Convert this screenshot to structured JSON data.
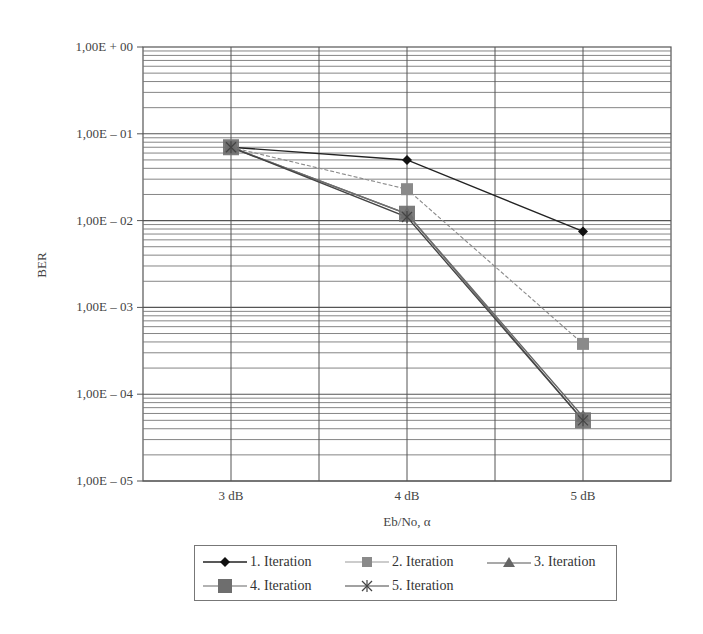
{
  "chart_data": {
    "type": "line",
    "title": "",
    "xlabel": "Eb/No, α",
    "ylabel": "BER",
    "yscale": "log",
    "ylim": [
      1e-05,
      1
    ],
    "categories": [
      "3 dB",
      "4 dB",
      "5 dB"
    ],
    "y_tick_labels": [
      "1,00E + 00",
      "1,00E – 01",
      "1,00E – 02",
      "1,00E – 03",
      "1,00E – 04",
      "1,00E – 05"
    ],
    "grid": true,
    "legend_position": "bottom",
    "series": [
      {
        "name": "1. Iteration",
        "values": [
          0.07,
          0.05,
          0.0075
        ],
        "marker": "diamond",
        "color": "#222222",
        "dash": "solid"
      },
      {
        "name": "2. Iteration",
        "values": [
          0.07,
          0.023,
          0.00038
        ],
        "marker": "square",
        "color": "#8a8a8a",
        "dash": "dashed"
      },
      {
        "name": "3. Iteration",
        "values": [
          0.07,
          0.012,
          5.5e-05
        ],
        "marker": "triangle",
        "color": "#666666",
        "dash": "solid"
      },
      {
        "name": "4. Iteration",
        "values": [
          0.07,
          0.012,
          5e-05
        ],
        "marker": "square-large",
        "color": "#6e6e6e",
        "dash": "solid"
      },
      {
        "name": "5. Iteration",
        "values": [
          0.07,
          0.011,
          5e-05
        ],
        "marker": "asterisk",
        "color": "#444444",
        "dash": "solid"
      }
    ]
  }
}
